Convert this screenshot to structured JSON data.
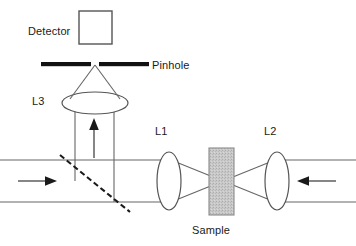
{
  "diagram": {
    "width": 356,
    "height": 246,
    "background_color": "#ffffff",
    "line_color": "#555555",
    "bold_line_color": "#111111",
    "sample_fill_color": "#c9c9c9",
    "sample_stroke_color": "#8a8a8a",
    "labels": {
      "detector": "Detector",
      "pinhole": "Pinhole",
      "lens3": "L3",
      "lens1": "L1",
      "lens2": "L2",
      "sample": "Sample"
    },
    "components": [
      {
        "name": "detector",
        "kind": "square-outline",
        "label": "Detector"
      },
      {
        "name": "pinhole",
        "kind": "two-bar-aperture",
        "label": "Pinhole"
      },
      {
        "name": "lens3",
        "kind": "horizontal-ellipse-lens",
        "label": "L3"
      },
      {
        "name": "lens1",
        "kind": "vertical-ellipse-lens",
        "label": "L1"
      },
      {
        "name": "lens2",
        "kind": "vertical-ellipse-lens",
        "label": "L2"
      },
      {
        "name": "sample",
        "kind": "hatched-slab",
        "label": "Sample"
      },
      {
        "name": "beam-splitter",
        "kind": "dashed-diagonal",
        "label": ""
      }
    ],
    "beam_directions": {
      "left_arrow_direction": "right",
      "right_arrow_direction": "left",
      "vertical_arrow_direction": "up"
    }
  }
}
